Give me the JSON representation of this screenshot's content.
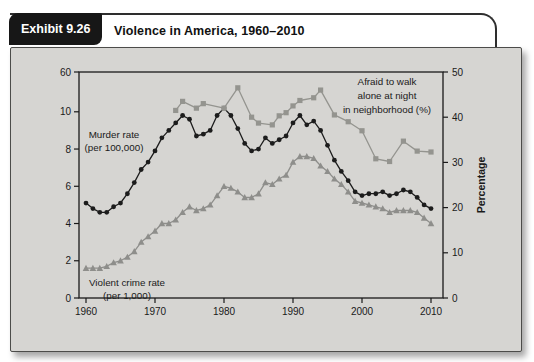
{
  "header": {
    "exhibit_label": "Exhibit 9.26",
    "title": "Violence in America, 1960–2010"
  },
  "colors": {
    "murder_line": "#1c1c1c",
    "gray_line": "#8e8e8b",
    "panel_bg": "#d6d5d2",
    "axis": "#1a1a1a",
    "tab_bg": "#171717"
  },
  "chart_data": {
    "type": "line",
    "title": "Violence in America, 1960–2010",
    "x_axis": {
      "ticks": [
        "1960",
        "1970",
        "1980",
        "1990",
        "2000",
        "2010"
      ],
      "range": [
        1960,
        2010
      ]
    },
    "left_axis": {
      "ticks": [
        "0",
        "2",
        "4",
        "6",
        "8",
        "10",
        "60"
      ],
      "broken_scale": true,
      "range_shown": [
        0,
        10
      ]
    },
    "right_axis": {
      "ticks": [
        "0",
        "10",
        "20",
        "30",
        "40",
        "50"
      ],
      "label": "Percentage",
      "range": [
        0,
        50
      ]
    },
    "legend_position": "annotations-inline",
    "grid": false,
    "series": [
      {
        "name": "Murder rate (per 100,000)",
        "axis": "left",
        "marker": "circle",
        "color": "#1c1c1c",
        "x": [
          1960,
          1961,
          1962,
          1963,
          1964,
          1965,
          1966,
          1967,
          1968,
          1969,
          1970,
          1971,
          1972,
          1973,
          1974,
          1975,
          1976,
          1977,
          1978,
          1979,
          1980,
          1981,
          1982,
          1983,
          1984,
          1985,
          1986,
          1987,
          1988,
          1989,
          1990,
          1991,
          1992,
          1993,
          1994,
          1995,
          1996,
          1997,
          1998,
          1999,
          2000,
          2001,
          2002,
          2003,
          2004,
          2005,
          2006,
          2007,
          2008,
          2009,
          2010
        ],
        "values": [
          5.1,
          4.8,
          4.6,
          4.6,
          4.9,
          5.1,
          5.6,
          6.2,
          6.9,
          7.3,
          7.9,
          8.6,
          9.0,
          9.4,
          9.8,
          9.6,
          8.7,
          8.8,
          9.0,
          9.8,
          10.2,
          9.8,
          9.1,
          8.3,
          7.9,
          8.0,
          8.6,
          8.3,
          8.5,
          8.7,
          9.4,
          9.8,
          9.3,
          9.5,
          9.0,
          8.2,
          7.4,
          6.8,
          6.3,
          5.7,
          5.5,
          5.6,
          5.6,
          5.7,
          5.5,
          5.6,
          5.8,
          5.7,
          5.4,
          5.0,
          4.8
        ]
      },
      {
        "name": "Violent crime rate (per 1,000)",
        "axis": "left",
        "marker": "triangle",
        "color": "#8e8e8b",
        "x": [
          1960,
          1961,
          1962,
          1963,
          1964,
          1965,
          1966,
          1967,
          1968,
          1969,
          1970,
          1971,
          1972,
          1973,
          1974,
          1975,
          1976,
          1977,
          1978,
          1979,
          1980,
          1981,
          1982,
          1983,
          1984,
          1985,
          1986,
          1987,
          1988,
          1989,
          1990,
          1991,
          1992,
          1993,
          1994,
          1995,
          1996,
          1997,
          1998,
          1999,
          2000,
          2001,
          2002,
          2003,
          2004,
          2005,
          2006,
          2007,
          2008,
          2009,
          2010
        ],
        "values": [
          1.6,
          1.6,
          1.6,
          1.7,
          1.9,
          2.0,
          2.2,
          2.5,
          3.0,
          3.3,
          3.6,
          4.0,
          4.0,
          4.2,
          4.6,
          4.9,
          4.7,
          4.8,
          5.0,
          5.5,
          6.0,
          5.9,
          5.7,
          5.4,
          5.4,
          5.6,
          6.2,
          6.1,
          6.4,
          6.6,
          7.3,
          7.6,
          7.6,
          7.5,
          7.1,
          6.8,
          6.4,
          6.1,
          5.7,
          5.2,
          5.1,
          5.0,
          4.9,
          4.8,
          4.6,
          4.7,
          4.7,
          4.7,
          4.6,
          4.3,
          4.0
        ]
      },
      {
        "name": "Afraid to walk alone at night in neighborhood (%)",
        "axis": "right",
        "marker": "square",
        "color": "#94948f",
        "x": [
          1973,
          1974,
          1976,
          1977,
          1980,
          1982,
          1984,
          1985,
          1987,
          1988,
          1989,
          1990,
          1991,
          1993,
          1994,
          1996,
          1998,
          2000,
          2002,
          2004,
          2006,
          2008,
          2010
        ],
        "values": [
          41.5,
          43.5,
          42,
          43,
          42,
          46.5,
          40,
          38.7,
          38.3,
          40.3,
          41,
          42.5,
          43.7,
          44.3,
          46,
          40.5,
          39,
          37,
          30.8,
          30.2,
          34.7,
          32.5,
          32.3
        ]
      }
    ],
    "annotations": [
      {
        "id": "murder-rate-label",
        "x": 103,
        "y": 90,
        "line_height": 13,
        "lines": [
          "Murder rate",
          "(per 100,000)"
        ]
      },
      {
        "id": "violent-crime-label",
        "x": 116,
        "y": 238,
        "line_height": 13,
        "lines": [
          "Violent crime rate",
          "(per 1,000)"
        ]
      },
      {
        "id": "afraid-label",
        "x": 376,
        "y": 37,
        "line_height": 14,
        "lines": [
          "Afraid to walk",
          "alone at night",
          "in neighborhood (%)"
        ]
      }
    ]
  }
}
